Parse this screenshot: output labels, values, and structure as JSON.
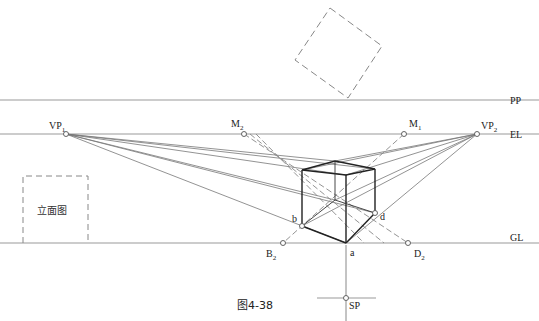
{
  "figure": {
    "caption": "图4-38",
    "elevation_label": "立面图"
  },
  "lines": {
    "pp": "PP",
    "el": "EL",
    "gl": "GL"
  },
  "points": {
    "vp1": {
      "main": "VP",
      "sub": "1"
    },
    "vp2": {
      "main": "VP",
      "sub": "2"
    },
    "m1": {
      "main": "M",
      "sub": "1"
    },
    "m2": {
      "main": "M",
      "sub": "2"
    },
    "b2": {
      "main": "B",
      "sub": "2"
    },
    "d2": {
      "main": "D",
      "sub": "2"
    },
    "a": "a",
    "b": "b",
    "d": "d",
    "sp": "SP"
  },
  "colors": {
    "line": "#555555",
    "guide": "#999999",
    "cube": "#222222"
  }
}
